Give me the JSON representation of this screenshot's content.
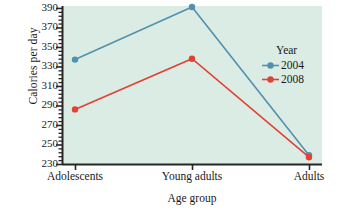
{
  "chart_data": {
    "type": "line",
    "title": "",
    "xlabel": "Age group",
    "ylabel": "Calories per day",
    "categories": [
      "Adolescents",
      "Young adults",
      "Adults"
    ],
    "series": [
      {
        "name": "2004",
        "color": "#5091ae",
        "values": [
          337,
          391,
          239
        ]
      },
      {
        "name": "2008",
        "color": "#e04234",
        "values": [
          286,
          338,
          237
        ]
      }
    ],
    "ylim": [
      230,
      392
    ],
    "yticks": [
      230,
      250,
      270,
      290,
      310,
      330,
      350,
      370,
      390
    ],
    "ytick_labels": [
      "230",
      "250",
      "270",
      "290",
      "310",
      "330",
      "350",
      "370",
      "390"
    ],
    "minor_ticks_per_interval": 4,
    "grid": false,
    "legend": {
      "title": "Year",
      "position": "inside-right",
      "entries": [
        "2004",
        "2008"
      ]
    },
    "plot_background": "#dbece5",
    "axis_color": "#262626"
  },
  "axes": {
    "y_title": "Calories per day",
    "x_title": "Age group"
  },
  "legend": {
    "title": "Year",
    "items": [
      {
        "label": "2004",
        "color": "#5091ae"
      },
      {
        "label": "2008",
        "color": "#e04234"
      }
    ]
  }
}
